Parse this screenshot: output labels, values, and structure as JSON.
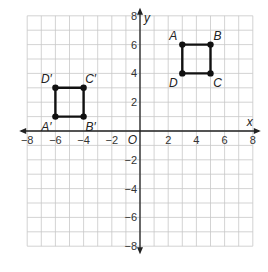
{
  "chart_data": {
    "type": "scatter",
    "title": "",
    "xlabel": "x",
    "ylabel": "y",
    "xlim": [
      -8,
      8
    ],
    "ylim": [
      -8,
      8
    ],
    "grid": true,
    "grid_step": 1,
    "x_ticks": [
      -8,
      -6,
      -4,
      -2,
      2,
      4,
      6,
      8
    ],
    "y_ticks": [
      8,
      6,
      4,
      2,
      -2,
      -4,
      -6,
      -8
    ],
    "origin_label": "O",
    "series": [
      {
        "name": "ABCD",
        "closed": true,
        "points": [
          {
            "label": "A",
            "x": 3,
            "y": 6
          },
          {
            "label": "B",
            "x": 5,
            "y": 6
          },
          {
            "label": "C",
            "x": 5,
            "y": 4
          },
          {
            "label": "D",
            "x": 3,
            "y": 4
          }
        ]
      },
      {
        "name": "A'B'C'D'",
        "closed": true,
        "points": [
          {
            "label": "A′",
            "x": -6,
            "y": 1
          },
          {
            "label": "B′",
            "x": -4,
            "y": 1
          },
          {
            "label": "C′",
            "x": -4,
            "y": 3
          },
          {
            "label": "D′",
            "x": -6,
            "y": 3
          }
        ]
      }
    ]
  },
  "colors": {
    "grid": "#c8c8c8",
    "axis": "#222222",
    "shape": "#111111"
  }
}
